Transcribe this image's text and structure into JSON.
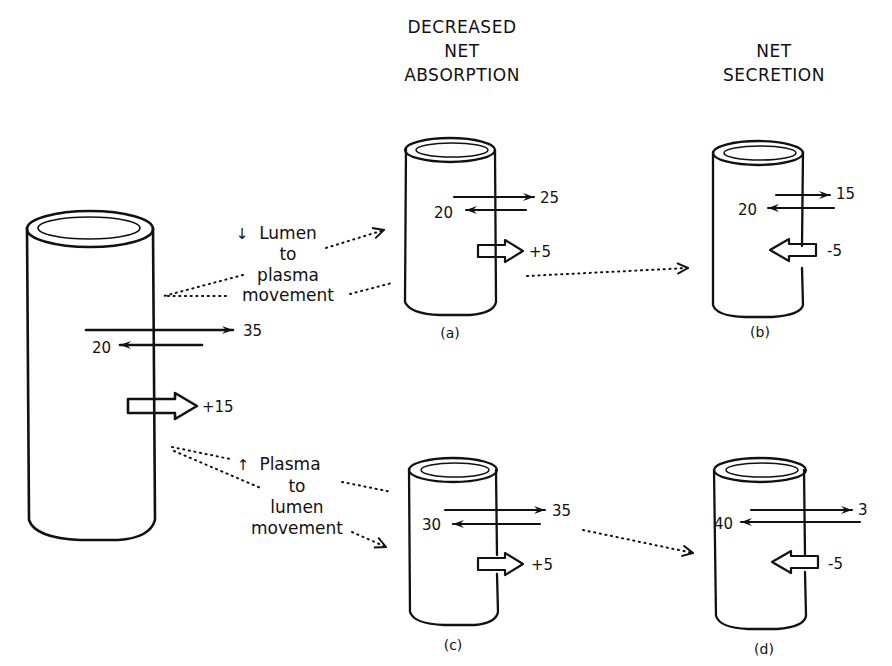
{
  "headers": {
    "decreased_absorption": [
      "DECREASED",
      "NET",
      "ABSORPTION"
    ],
    "net_secretion": [
      "NET",
      "SECRETION"
    ]
  },
  "labels": {
    "top_mechanism": {
      "arrow_glyph": "↓",
      "lines": [
        "Lumen",
        "to",
        "plasma",
        "movement"
      ]
    },
    "bottom_mechanism": {
      "arrow_glyph": "↑",
      "lines": [
        "Plasma",
        "to",
        "lumen",
        "movement"
      ]
    }
  },
  "cylinders": {
    "baseline": {
      "caption": "",
      "lumen_to_plasma": "35",
      "plasma_to_lumen": "20",
      "net": "+15",
      "net_direction": "out"
    },
    "a": {
      "caption": "(a)",
      "lumen_to_plasma": "25",
      "plasma_to_lumen": "20",
      "net": "+5",
      "net_direction": "out"
    },
    "b": {
      "caption": "(b)",
      "lumen_to_plasma": "15",
      "plasma_to_lumen": "20",
      "net": "-5",
      "net_direction": "in"
    },
    "c": {
      "caption": "(c)",
      "lumen_to_plasma": "35",
      "plasma_to_lumen": "30",
      "net": "+5",
      "net_direction": "out"
    },
    "d": {
      "caption": "(d)",
      "lumen_to_plasma": "3",
      "plasma_to_lumen": "40",
      "net": "-5",
      "net_direction": "in"
    }
  },
  "icons": {
    "flux_arrow": "line-arrow",
    "net_flux_arrow": "hollow-block-arrow",
    "transition_arrow": "dotted-arrow"
  },
  "colors": {
    "ink": "#111111",
    "background": "#ffffff"
  }
}
